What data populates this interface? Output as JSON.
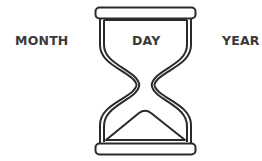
{
  "labels": {
    "month": "MONTH",
    "day": "DAY",
    "year": "YEAR"
  },
  "icon": "hourglass-icon",
  "colors": {
    "stroke": "#2a2a2a",
    "text": "#3a3a3a",
    "background": "#ffffff"
  }
}
